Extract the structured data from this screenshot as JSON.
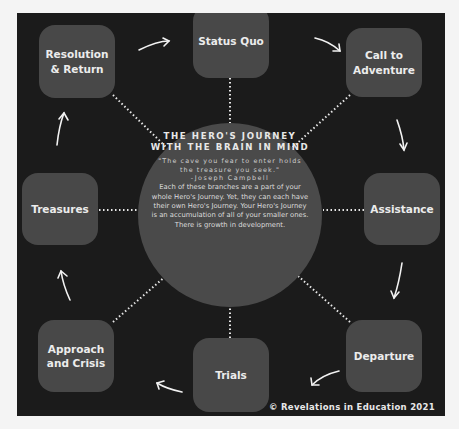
{
  "title": "The Hero's Journey with the Brain in Mind",
  "center": {
    "title": "THE HERO'S JOURNEY WITH THE BRAIN IN MIND",
    "quote": "\"The cave you fear to enter holds the treasure you seek.\"",
    "author": "-Joseph Campbell",
    "body": "Each of these branches are a part of your whole Hero's Journey. Yet, they can each have their own Hero's Journey. Your Hero's Journey is an accumulation of all of your smaller ones. There is growth in development."
  },
  "stages": [
    {
      "id": "status-quo",
      "label": "Status Quo"
    },
    {
      "id": "call-to-adventure",
      "label": "Call to Adventure"
    },
    {
      "id": "assistance",
      "label": "Assistance"
    },
    {
      "id": "departure",
      "label": "Departure"
    },
    {
      "id": "trials",
      "label": "Trials"
    },
    {
      "id": "approach-and-crisis",
      "label": "Approach and Crisis"
    },
    {
      "id": "treasures",
      "label": "Treasures"
    },
    {
      "id": "resolution-and-return",
      "label": "Resolution & Return"
    }
  ],
  "copyright": "© Revelations in Education 2021",
  "colors": {
    "background": "#1b1b1b",
    "node": "#484848",
    "circle": "#4a4a4a",
    "text": "#ececec"
  }
}
